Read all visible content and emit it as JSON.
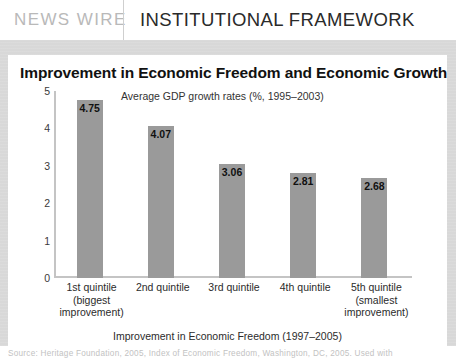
{
  "header": {
    "brand": "NEWS WIRE",
    "section": "INSTITUTIONAL FRAMEWORK"
  },
  "figure": {
    "title": "Improvement in Economic Freedom and Economic Growth",
    "subtitle": "Average GDP growth rates (%, 1995–2003)",
    "source": "Source: Heritage Foundation, 2005, Index of Economic Freedom, Washington, DC, 2005. Used with"
  },
  "chart_data": {
    "type": "bar",
    "title": "Improvement in Economic Freedom and Economic Growth",
    "subtitle": "Average GDP growth rates (%, 1995–2003)",
    "xlabel": "Improvement in Economic Freedom (1997–2005)",
    "ylabel": "",
    "ylim": [
      0,
      5
    ],
    "yticks": [
      "0",
      "1",
      "2",
      "3",
      "4",
      "5"
    ],
    "grid": false,
    "legend": false,
    "bar_color": "#9a9a9a",
    "categories": [
      "1st quintile\n(biggest\nimprovement)",
      "2nd quintile",
      "3rd quintile",
      "4th quintile",
      "5th quintile\n(smallest\nimprovement)"
    ],
    "values": [
      4.75,
      4.07,
      3.06,
      2.81,
      2.68
    ],
    "value_labels": [
      "4.75",
      "4.07",
      "3.06",
      "2.81",
      "2.68"
    ]
  }
}
